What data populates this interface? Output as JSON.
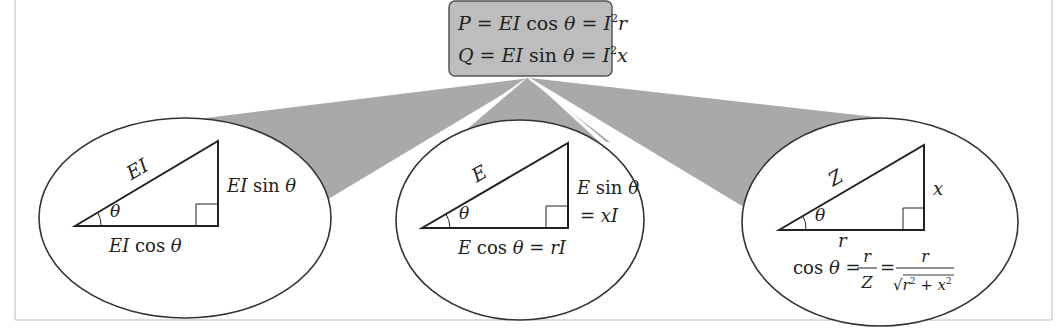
{
  "top_box": {
    "line1": {
      "lhs": "P",
      "eq1": " = ",
      "mid": "EI",
      "fn": " cos ",
      "theta": "θ",
      "eq2": " = ",
      "rhs": "I",
      "sup": "2",
      "rhs2": "r"
    },
    "line2": {
      "lhs": "Q",
      "eq1": " = ",
      "mid": "EI",
      "fn": " sin ",
      "theta": "θ",
      "eq2": " = ",
      "rhs": "I",
      "sup": "2",
      "rhs2": "x"
    },
    "fill": "#bdbdbd"
  },
  "triangles": [
    {
      "name": "power",
      "hypotenuse": "EI",
      "vertical": {
        "var": "EI",
        "fn": " sin ",
        "theta": "θ"
      },
      "base": {
        "var": "EI",
        "fn": " cos ",
        "theta": "θ"
      },
      "angle": "θ"
    },
    {
      "name": "voltage",
      "hypotenuse": "E",
      "vertical": {
        "var": "E",
        "fn": " sin ",
        "theta": "θ",
        "eq": "= ",
        "rhs": "xI"
      },
      "base": {
        "var": "E",
        "fn": " cos ",
        "theta": "θ",
        "eq": " = ",
        "rhs": "rI"
      },
      "angle": "θ"
    },
    {
      "name": "impedance",
      "hypotenuse": "Z",
      "vertical": {
        "var": "x"
      },
      "base": {
        "var": "r"
      },
      "angle": "θ",
      "formula": {
        "fn": "cos ",
        "theta": "θ",
        "eq": " = ",
        "num1": "r",
        "den1": "Z",
        "eq2": " = ",
        "num2": "r",
        "den2_a": "r",
        "den2_sup_a": "2",
        "den2_plus": " + ",
        "den2_b": "x",
        "den2_sup_b": "2",
        "sqrt": "√"
      }
    }
  ],
  "colors": {
    "wedge": "#a9a9a9",
    "stroke": "#333333",
    "frame": "#cfcfcf"
  }
}
